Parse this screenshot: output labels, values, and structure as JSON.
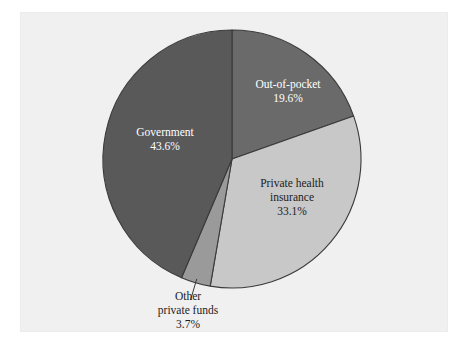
{
  "figure": {
    "background_color": "#ffffff",
    "panel_color": "#f0f0f0",
    "outline_color": "#3a3a3a"
  },
  "chart_data": {
    "type": "pie",
    "title": "",
    "subtitle": "",
    "xlabel": "",
    "ylabel": "",
    "legend_position": "none",
    "grid": false,
    "start_angle_deg": 0,
    "direction": "clockwise",
    "units": "percent",
    "total": 100.0,
    "categories": [
      "Out-of-pocket",
      "Private health insurance",
      "Other private funds",
      "Government"
    ],
    "values": [
      19.6,
      33.1,
      3.7,
      43.6
    ],
    "colors": [
      "#6a6a6b",
      "#c8c8c8",
      "#9a9a9a",
      "#59595a"
    ],
    "slices": [
      {
        "name": "out-of-pocket",
        "label_line1": "Out-of-pocket",
        "label_line2": "",
        "value_label": "19.6%",
        "value": 19.6,
        "color": "#6a6a6b",
        "text_color": "#ffffff",
        "label_placement": "inside",
        "start_deg": 0.0,
        "end_deg": 70.56
      },
      {
        "name": "private-health-insurance",
        "label_line1": "Private health",
        "label_line2": "insurance",
        "value_label": "33.1%",
        "value": 33.1,
        "color": "#c8c8c8",
        "text_color": "#1c1c1c",
        "label_placement": "inside",
        "start_deg": 70.56,
        "end_deg": 189.72
      },
      {
        "name": "other-private-funds",
        "label_line1": "Other",
        "label_line2": "private funds",
        "value_label": "3.7%",
        "value": 3.7,
        "color": "#9a9a9a",
        "text_color": "#1c1c1c",
        "label_placement": "outside",
        "start_deg": 189.72,
        "end_deg": 203.04
      },
      {
        "name": "government",
        "label_line1": "Government",
        "label_line2": "",
        "value_label": "43.6%",
        "value": 43.6,
        "color": "#59595a",
        "text_color": "#ffffff",
        "label_placement": "inside",
        "start_deg": 203.04,
        "end_deg": 360.0
      }
    ]
  }
}
